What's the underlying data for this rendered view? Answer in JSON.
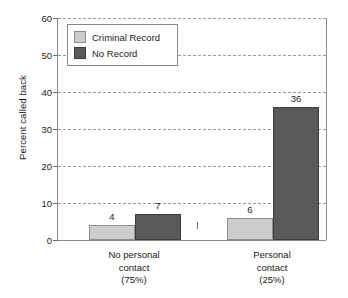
{
  "chart_data": {
    "type": "bar",
    "title": "",
    "subtitle": "",
    "xlabel": "",
    "ylabel": "Percent called back",
    "ylim": [
      0,
      60
    ],
    "ytick_step": 10,
    "yticks": [
      0,
      10,
      20,
      30,
      40,
      50,
      60
    ],
    "ytick_labels": [
      "0",
      "10",
      "20",
      "30",
      "40",
      "50",
      "60"
    ],
    "grid": "horizontal-dashed",
    "legend_position": "top-left-inside",
    "categories": [
      "No personal contact (75%)",
      "Personal contact (25%)"
    ],
    "category_lines": [
      [
        "No personal",
        "contact",
        "(75%)"
      ],
      [
        "Personal",
        "contact",
        "(25%)"
      ]
    ],
    "series": [
      {
        "name": "Criminal Record",
        "color": "#cdcdcd",
        "values": [
          4,
          6
        ],
        "value_labels": [
          "4",
          "6"
        ]
      },
      {
        "name": "No Record",
        "color": "#595959",
        "values": [
          7,
          36
        ],
        "value_labels": [
          "7",
          "36"
        ]
      }
    ]
  },
  "legend": {
    "items": [
      {
        "label": "Criminal Record",
        "color": "#cdcdcd"
      },
      {
        "label": "No Record",
        "color": "#595959"
      }
    ]
  },
  "axes": {
    "y_title": "Percent called back",
    "y_tick_labels": [
      "60",
      "50",
      "40",
      "30",
      "20",
      "10",
      "0"
    ]
  },
  "colors": {
    "criminal_record": "#cdcdcd",
    "no_record": "#595959",
    "axis": "#8a8a8a",
    "gridline": "#9a9a9a",
    "background": "#ffffff",
    "text": "#1a1a1a"
  }
}
